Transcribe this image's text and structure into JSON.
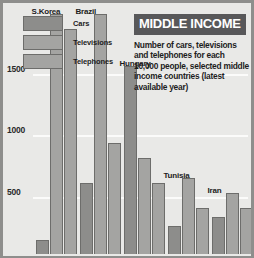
{
  "title": "MIDDLE INCOME",
  "subtitle": "Number of cars, televisions and telephones for each 10,000 people, selected middle income countries (latest available year)",
  "legend": {
    "items": [
      {
        "label": "Cars",
        "color": "#8d8d8b",
        "key": "cars"
      },
      {
        "label": "Televisions",
        "color": "#a4a4a2",
        "key": "televisions"
      },
      {
        "label": "Telephones",
        "color": "#a4a4a2",
        "key": "telephones"
      }
    ]
  },
  "colors": {
    "background": "#e9e9e7",
    "border": "#8e8e8c",
    "gridline": "#fbfbfa",
    "banner": "#58585a",
    "bar_outline": "#6d6d6b",
    "text": "#1d1d1d"
  },
  "axis": {
    "y_ticks": [
      "500",
      "1000",
      "1500"
    ],
    "y_tick_values": [
      500,
      1000,
      1500
    ]
  },
  "chart_data": {
    "type": "bar",
    "title": "MIDDLE INCOME",
    "subtitle": "Number of cars, televisions and telephones for each 10,000 people, selected middle income countries (latest available year)",
    "xlabel": "",
    "ylabel": "",
    "ylim": [
      0,
      2050
    ],
    "grid": true,
    "legend_position": "top-left",
    "categories": [
      "S.Korea",
      "Brazil",
      "Hungary",
      "Tunisia",
      "Iran"
    ],
    "series": [
      {
        "name": "Cars",
        "values": [
          110,
          575,
          1530,
          230,
          300
        ]
      },
      {
        "name": "Televisions",
        "values": [
          1950,
          1950,
          780,
          620,
          500
        ]
      },
      {
        "name": "Telephones",
        "values": [
          1830,
          900,
          575,
          375,
          375
        ]
      }
    ],
    "yticks": [
      500,
      1000,
      1500
    ],
    "ytick_labels": [
      "500",
      "1000",
      "1500"
    ]
  }
}
